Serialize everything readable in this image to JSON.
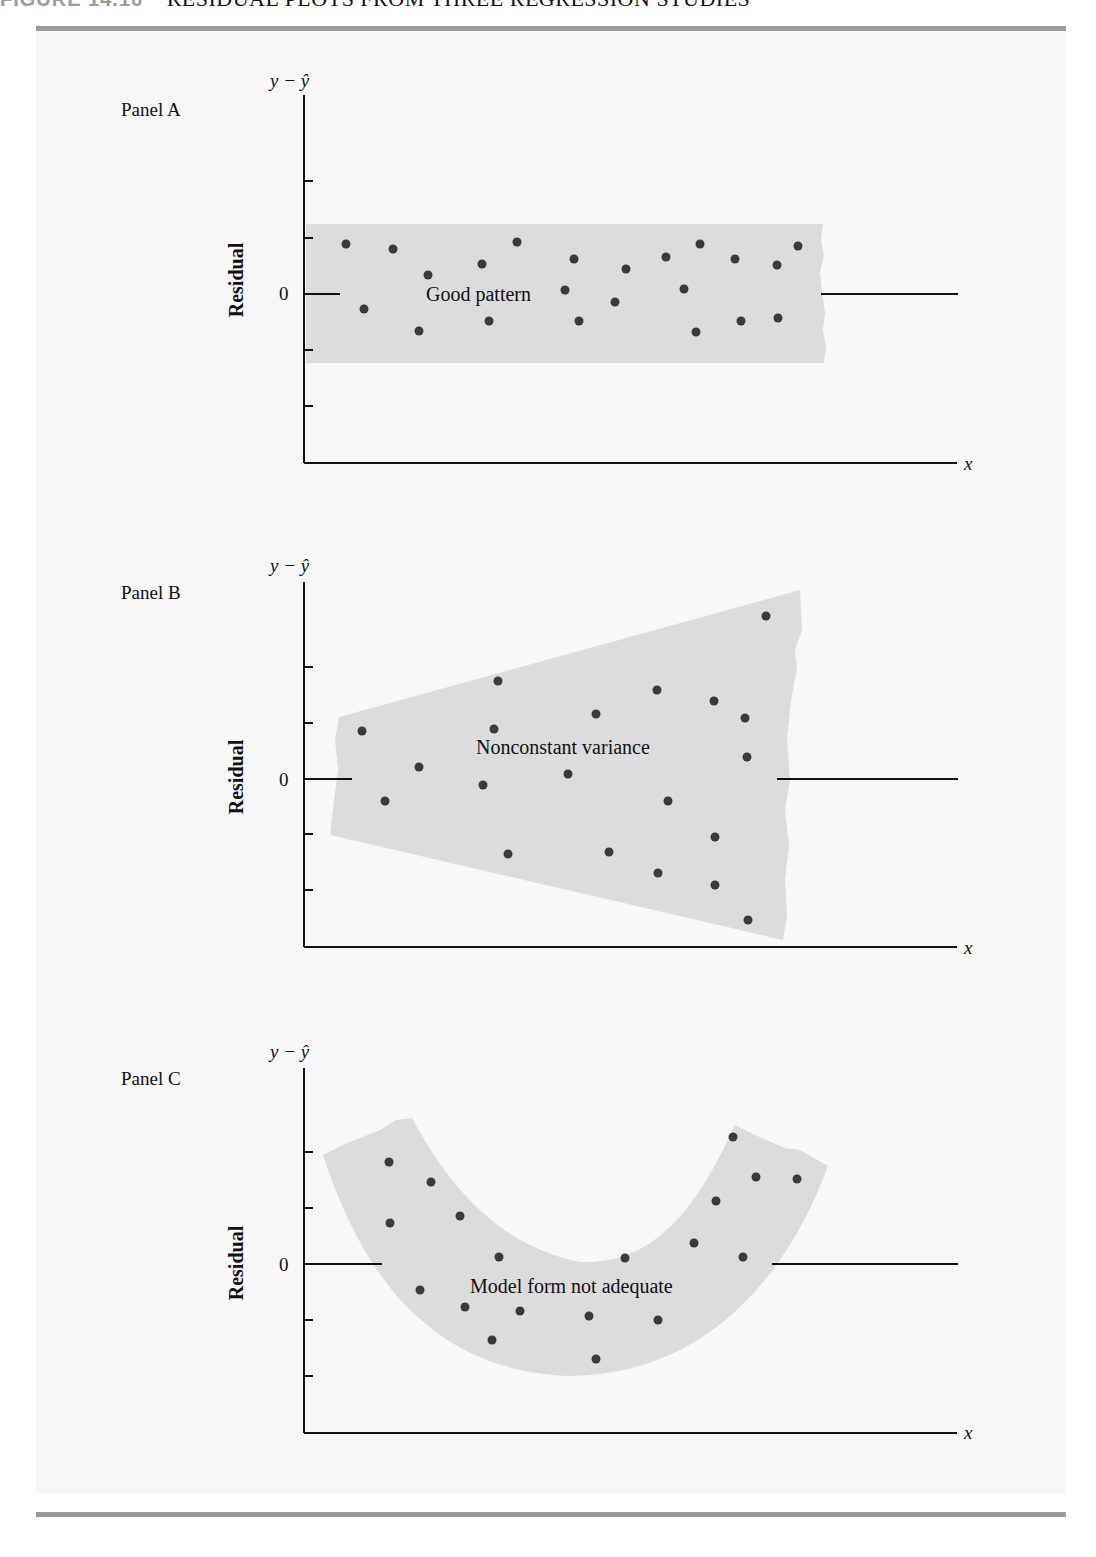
{
  "figure": {
    "number": "FIGURE 14.16",
    "caption": "RESIDUAL PLOTS FROM THREE REGRESSION STUDIES"
  },
  "colors": {
    "band": "#dcdcdc",
    "point": "#3a3a3a",
    "axis": "#111111",
    "rule": "#9b9b9b",
    "panel_bg": "#f7f7f7"
  },
  "chart_data": [
    {
      "type": "scatter",
      "title": "Panel A",
      "annotation": "Good pattern",
      "ylabel": "Residual",
      "yaxis_top_label": "y − ŷ",
      "xlabel": "x",
      "ytick_label": "0",
      "band": "horizontal band of constant width around zero",
      "points_px": [
        [
          346,
          244
        ],
        [
          364,
          309
        ],
        [
          393,
          249
        ],
        [
          419,
          331
        ],
        [
          428,
          275
        ],
        [
          482,
          264
        ],
        [
          489,
          321
        ],
        [
          517,
          242
        ],
        [
          565,
          290
        ],
        [
          574,
          259
        ],
        [
          579,
          321
        ],
        [
          615,
          302
        ],
        [
          626,
          269
        ],
        [
          666,
          257
        ],
        [
          684,
          289
        ],
        [
          696,
          332
        ],
        [
          700,
          244
        ],
        [
          741,
          321
        ],
        [
          735,
          259
        ],
        [
          778,
          318
        ],
        [
          777,
          265
        ],
        [
          798,
          246
        ]
      ]
    },
    {
      "type": "scatter",
      "title": "Panel B",
      "annotation": "Nonconstant variance",
      "ylabel": "Residual",
      "yaxis_top_label": "y − ŷ",
      "xlabel": "x",
      "ytick_label": "0",
      "band": "funnel widening to the right",
      "points_px": [
        [
          362,
          731
        ],
        [
          385,
          801
        ],
        [
          419,
          767
        ],
        [
          483,
          785
        ],
        [
          494,
          729
        ],
        [
          498,
          681
        ],
        [
          508,
          854
        ],
        [
          568,
          774
        ],
        [
          596,
          714
        ],
        [
          609,
          852
        ],
        [
          658,
          873
        ],
        [
          657,
          690
        ],
        [
          668,
          801
        ],
        [
          715,
          837
        ],
        [
          714,
          701
        ],
        [
          715,
          885
        ],
        [
          745,
          718
        ],
        [
          748,
          920
        ],
        [
          747,
          757
        ],
        [
          766,
          616
        ]
      ]
    },
    {
      "type": "scatter",
      "title": "Panel C",
      "annotation": "Model form not adequate",
      "ylabel": "Residual",
      "yaxis_top_label": "y − ŷ",
      "xlabel": "x",
      "ytick_label": "0",
      "band": "U-shaped curved band",
      "points_px": [
        [
          389,
          1162
        ],
        [
          390,
          1223
        ],
        [
          420,
          1290
        ],
        [
          431,
          1182
        ],
        [
          460,
          1216
        ],
        [
          465,
          1307
        ],
        [
          492,
          1340
        ],
        [
          499,
          1257
        ],
        [
          520,
          1311
        ],
        [
          589,
          1316
        ],
        [
          596,
          1359
        ],
        [
          625,
          1258
        ],
        [
          658,
          1320
        ],
        [
          694,
          1243
        ],
        [
          716,
          1201
        ],
        [
          733,
          1137
        ],
        [
          743,
          1257
        ],
        [
          756,
          1177
        ],
        [
          797,
          1179
        ]
      ]
    }
  ]
}
